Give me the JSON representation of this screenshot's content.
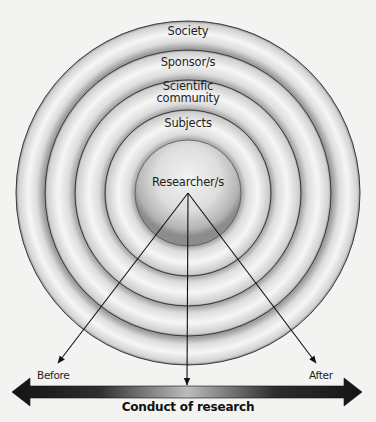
{
  "diagram": {
    "type": "concentric-circles",
    "center": {
      "x": 188,
      "y": 193
    },
    "rings": [
      {
        "label": "Society",
        "radius": 172,
        "label_y": 26
      },
      {
        "label": "Sponsor/s",
        "radius": 143,
        "label_y": 57
      },
      {
        "label": "Scientific\ncommunity",
        "radius": 113,
        "label_y": 84
      },
      {
        "label": "Subjects",
        "radius": 83,
        "label_y": 119
      }
    ],
    "core": {
      "label": "Researcher/s",
      "radius": 53,
      "label_y": 178
    },
    "arrows": [
      {
        "name": "before",
        "from": [
          188,
          193
        ],
        "to": [
          58,
          363
        ]
      },
      {
        "name": "during",
        "from": [
          188,
          193
        ],
        "to": [
          187,
          384
        ]
      },
      {
        "name": "after",
        "from": [
          188,
          193
        ],
        "to": [
          316,
          363
        ]
      }
    ],
    "timeline": {
      "title": "Conduct of research",
      "start_label": "Before",
      "end_label": "After",
      "y": 392,
      "x_start": 12,
      "x_end": 362
    },
    "colors": {
      "background": "#f3f3f1",
      "ring_edge": "#3a3a3a",
      "ring_light": "#f7f7f7",
      "ring_dark": "#a9a9a9",
      "bar_dark": "#161616",
      "bar_light": "#b8b8b8",
      "text": "#1e1e1e"
    }
  },
  "labels": {
    "ring1": "Society",
    "ring2": "Sponsor/s",
    "ring3_line1": "Scientific",
    "ring3_line2": "community",
    "ring4": "Subjects",
    "core": "Researcher/s",
    "before": "Before",
    "after": "After",
    "timeline_title": "Conduct of research"
  }
}
